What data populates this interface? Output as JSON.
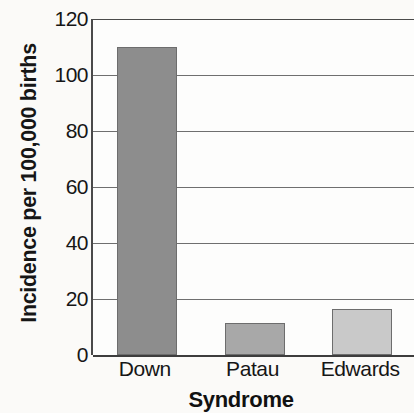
{
  "chart_data": {
    "type": "bar",
    "title": "",
    "subtitle": "",
    "xlabel": "Syndrome",
    "ylabel": "Incidence per 100,000 births",
    "categories": [
      "Down",
      "Patau",
      "Edwards"
    ],
    "values": [
      110,
      11.5,
      16.5
    ],
    "series": [
      {
        "name": "Incidence per 100,000 births",
        "values": [
          110,
          11.5,
          16.5
        ]
      }
    ],
    "ylim": [
      0,
      120
    ],
    "xlim": [
      0,
      3
    ],
    "yticks": [
      0,
      20,
      40,
      60,
      80,
      100,
      120
    ],
    "ytick_labels": [
      "0",
      "20",
      "40",
      "60",
      "80",
      "100",
      "120"
    ],
    "grid": "horizontal",
    "legend": "none",
    "legend_position": "none",
    "annotations": [],
    "bar_colors": [
      "#8d8d8d",
      "#a8a8a8",
      "#c9c9c9"
    ],
    "bar_edge_color": "#6d6d6d",
    "axis_color": "#3d3d3d",
    "gridline_color": "#6f6f6f",
    "background_color": "#fbfaf8",
    "plot_background_color": "#fdfdfc",
    "text_color": "#161616"
  }
}
